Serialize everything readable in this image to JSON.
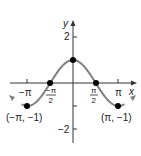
{
  "chart_data": {
    "type": "line",
    "title": "",
    "function": "y = cos x",
    "xlabel": "x",
    "ylabel": "y",
    "x_ticks": [
      "−π",
      "−π/2",
      "π/2",
      "π"
    ],
    "y_ticks": [
      "2",
      "−2"
    ],
    "xlim": [
      -3.6,
      3.6
    ],
    "ylim": [
      -2.6,
      2.6
    ],
    "points": [
      {
        "x": "-π",
        "y": -1,
        "label": "(−π, −1)"
      },
      {
        "x": "-π/2",
        "y": 0
      },
      {
        "x": "0",
        "y": 1
      },
      {
        "x": "π/2",
        "y": 0
      },
      {
        "x": "π",
        "y": -1,
        "label": "(π, −1)"
      }
    ],
    "curve_color": "#808080",
    "point_color": "#000000"
  },
  "labels": {
    "x_axis": "x",
    "y_axis": "y",
    "y_tick_2": "2",
    "y_tick_neg2": "−2",
    "x_tick_neg_pi": "−π",
    "x_tick_pi": "π",
    "x_tick_half_num": "π",
    "x_tick_half_den": "2",
    "x_tick_neg_half_num": "−π",
    "point_left": "(−π, −1)",
    "point_right": "(π, −1)"
  }
}
